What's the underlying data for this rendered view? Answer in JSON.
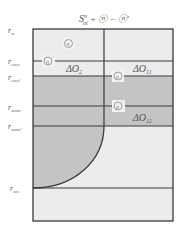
{
  "title": {
    "base": "S",
    "sup": "n",
    "sub": "ot",
    "rest": " + ⓝ − ⓝ'"
  },
  "axis_labels": [
    {
      "main": "r",
      "sub": "w",
      "y": 30
    },
    {
      "main": "r",
      "sub": "owo",
      "y": 61
    },
    {
      "main": "r",
      "sub": "owo'",
      "y": 77
    },
    {
      "main": "r",
      "sub": "wom",
      "y": 107
    },
    {
      "main": "r",
      "sub": "wom'",
      "y": 126
    },
    {
      "main": "r",
      "sub": "wo",
      "y": 188
    }
  ],
  "regions": {
    "delta_o2": {
      "main": "ΔO",
      "sub": "2"
    },
    "delta_o11": {
      "main": "ΔO",
      "sub": "11"
    },
    "delta_o12": {
      "main": "ΔO",
      "sub": "12"
    }
  },
  "markers": [
    {
      "text": "n",
      "prime": "",
      "x": 68,
      "y": 43
    },
    {
      "text": "n",
      "prime": "'",
      "x": 48,
      "y": 61
    },
    {
      "text": "n",
      "prime": "",
      "x": 118,
      "y": 76
    },
    {
      "text": "n",
      "prime": "'",
      "x": 118,
      "y": 106
    }
  ],
  "colors": {
    "light_fill": "#ececec",
    "dark_fill": "#c4c4c4",
    "line": "#3a3a3a",
    "label": "#555555"
  }
}
